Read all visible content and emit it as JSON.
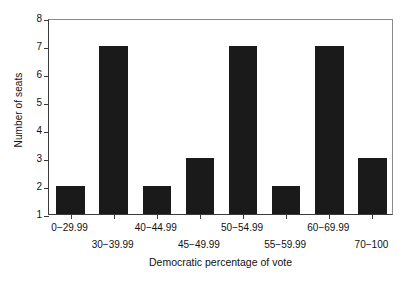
{
  "chart_data": {
    "type": "bar",
    "title": "",
    "subtitle": "",
    "xlabel": "Democratic percentage of vote",
    "ylabel": "Number of seats",
    "categories": [
      "0−29.99",
      "30−39.99",
      "40−44.99",
      "45−49.99",
      "50−54.99",
      "55−59.99",
      "60−69.99",
      "70−100"
    ],
    "values": [
      2,
      7,
      2,
      3,
      7,
      2,
      7,
      3
    ],
    "ylim": [
      1,
      8
    ],
    "yticks": [
      1,
      2,
      3,
      4,
      5,
      6,
      7,
      8
    ],
    "ytick_labels": [
      "1",
      "2",
      "3",
      "4",
      "5",
      "6",
      "7",
      "8"
    ],
    "xtick_label_rows": [
      0,
      1,
      0,
      1,
      0,
      1,
      0,
      1
    ],
    "grid": false,
    "legend": false,
    "legend_position": "none",
    "bar_color": "#1a1a1a",
    "axis_color": "#3a3a3a",
    "background_color": "#ffffff"
  }
}
